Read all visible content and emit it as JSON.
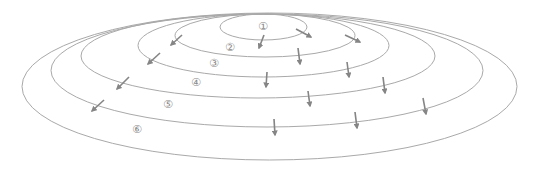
{
  "diagram": {
    "type": "nested-concentric-ellipses",
    "colors": {
      "ring_stroke": "#a9a9a9",
      "arrow_stroke": "#858585",
      "label_text": "#8a8a8a",
      "background": "#ffffff"
    },
    "rings": [
      {
        "id": "ring-1",
        "cx": 263.5,
        "cy": 27,
        "rx": 43.5,
        "ry": 13
      },
      {
        "id": "ring-2",
        "cx": 265,
        "cy": 35.5,
        "rx": 90,
        "ry": 21.5
      },
      {
        "id": "ring-3",
        "cx": 263.5,
        "cy": 45.5,
        "rx": 125.5,
        "ry": 31.5
      },
      {
        "id": "ring-4",
        "cx": 258,
        "cy": 56,
        "rx": 177,
        "ry": 42
      },
      {
        "id": "ring-5",
        "cx": 267,
        "cy": 70.5,
        "rx": 216,
        "ry": 56.5
      },
      {
        "id": "ring-6",
        "cx": 269.5,
        "cy": 86.5,
        "rx": 247.5,
        "ry": 73.5
      }
    ],
    "labels": [
      {
        "text": "①",
        "x": 263,
        "y": 26
      },
      {
        "text": "②",
        "x": 230,
        "y": 47
      },
      {
        "text": "③",
        "x": 214,
        "y": 63
      },
      {
        "text": "④",
        "x": 196,
        "y": 82
      },
      {
        "text": "⑤",
        "x": 168,
        "y": 104
      },
      {
        "text": "⑥",
        "x": 137,
        "y": 129
      }
    ],
    "arrows": [
      {
        "x1": 264,
        "y1": 35,
        "x2": 259,
        "y2": 48
      },
      {
        "x1": 296,
        "y1": 29,
        "x2": 311,
        "y2": 37
      },
      {
        "x1": 345,
        "y1": 35,
        "x2": 360,
        "y2": 42
      },
      {
        "x1": 298,
        "y1": 48,
        "x2": 300,
        "y2": 64
      },
      {
        "x1": 182,
        "y1": 35,
        "x2": 171,
        "y2": 45
      },
      {
        "x1": 267,
        "y1": 72,
        "x2": 266,
        "y2": 87
      },
      {
        "x1": 347,
        "y1": 62,
        "x2": 349,
        "y2": 77
      },
      {
        "x1": 160,
        "y1": 53,
        "x2": 148,
        "y2": 64
      },
      {
        "x1": 308,
        "y1": 91,
        "x2": 310,
        "y2": 106
      },
      {
        "x1": 383,
        "y1": 77,
        "x2": 385,
        "y2": 93
      },
      {
        "x1": 129,
        "y1": 77,
        "x2": 117,
        "y2": 89
      },
      {
        "x1": 274,
        "y1": 119,
        "x2": 275,
        "y2": 135
      },
      {
        "x1": 355,
        "y1": 112,
        "x2": 357,
        "y2": 128
      },
      {
        "x1": 423,
        "y1": 98,
        "x2": 426,
        "y2": 114
      },
      {
        "x1": 104,
        "y1": 100,
        "x2": 92,
        "y2": 111
      }
    ]
  }
}
